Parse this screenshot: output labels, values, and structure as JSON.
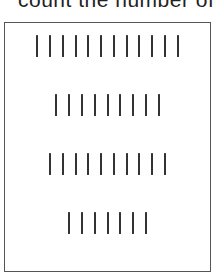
{
  "prompt": {
    "text": "count the number of"
  },
  "panel": {
    "rows": [
      {
        "label": "row-1",
        "count": 12
      },
      {
        "label": "row-2",
        "count": 9
      },
      {
        "label": "row-3",
        "count": 10
      },
      {
        "label": "row-4",
        "count": 7
      }
    ]
  },
  "colors": {
    "bar": "#333333",
    "border": "#555555",
    "background": "#ffffff"
  }
}
